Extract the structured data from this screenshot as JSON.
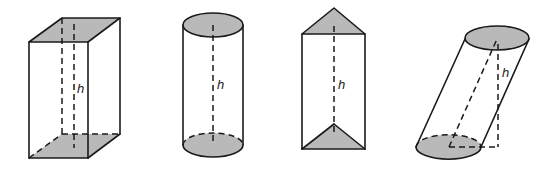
{
  "figure": {
    "shading_color": "#b9b9b9",
    "line_color": "#1a1a1a",
    "shapes": [
      {
        "id": "rectangular-prism",
        "height_label": "h"
      },
      {
        "id": "right-cylinder",
        "height_label": "h"
      },
      {
        "id": "triangular-prism",
        "height_label": "h"
      },
      {
        "id": "oblique-cylinder",
        "height_label": "h"
      }
    ]
  }
}
